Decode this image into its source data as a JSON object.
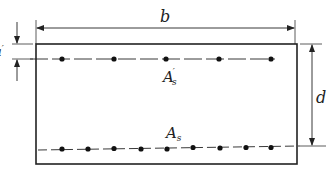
{
  "diagram": {
    "type": "reinforced-concrete-section",
    "labels": {
      "width": "b",
      "effective_depth": "d",
      "cover_top": "a",
      "cover_top_prime": "′",
      "compression_steel_main": "A",
      "compression_steel_prime": "′",
      "compression_steel_sub": "s",
      "tension_steel_main": "A",
      "tension_steel_sub": "s"
    },
    "compression_bars_count": 5,
    "tension_bars_count": 9,
    "colors": {
      "line": "#222222",
      "background": "#ffffff"
    }
  }
}
